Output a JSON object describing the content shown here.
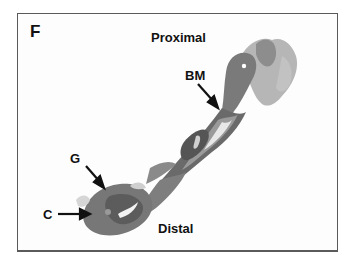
{
  "figure": {
    "panel_letter": "F",
    "labels": {
      "proximal": "Proximal",
      "distal": "Distal",
      "bm": "BM",
      "g": "G",
      "c": "C"
    },
    "colors": {
      "frame": "#5a5a5a",
      "tissue_dark": "#5e5e5e",
      "tissue_mid": "#8a8a8a",
      "tissue_light": "#b5b5b5",
      "text": "#111111"
    }
  }
}
